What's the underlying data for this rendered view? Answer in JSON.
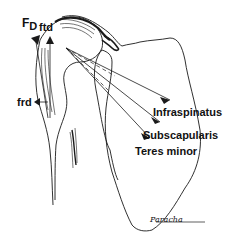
{
  "figure": {
    "labels": {
      "fd_main": "F",
      "fd_sub": "D",
      "ftd": "ftd",
      "frd": "frd",
      "infraspinatus": "Infraspinatus",
      "subscapularis": "Subscapularis",
      "teres_minor": "Teres minor"
    },
    "signature": "Paracha",
    "colors": {
      "line": "#1a1a1a",
      "background": "#ffffff"
    }
  }
}
